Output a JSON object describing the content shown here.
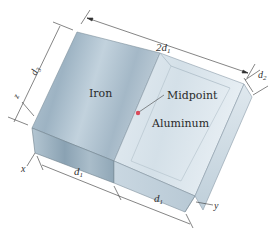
{
  "figure": {
    "materials": {
      "left": "Iron",
      "right": "Aluminum"
    },
    "point_label": "Midpoint",
    "point_color": "#d94a5a",
    "dimensions": {
      "top_length": "2d",
      "top_length_sub": "1",
      "depth": "d",
      "depth_sub": "2",
      "side": "d",
      "side_sub": "3",
      "bottom_left": "d",
      "bottom_left_sub": "1",
      "bottom_right": "d",
      "bottom_right_sub": "1"
    },
    "axes": {
      "x": "x",
      "y": "y",
      "z": "z"
    },
    "colors": {
      "iron_top": "#a9bccb",
      "aluminum_top": "#d9e4ec",
      "front_face": "#9fb3c2",
      "edge": "#6d7f8c"
    }
  }
}
